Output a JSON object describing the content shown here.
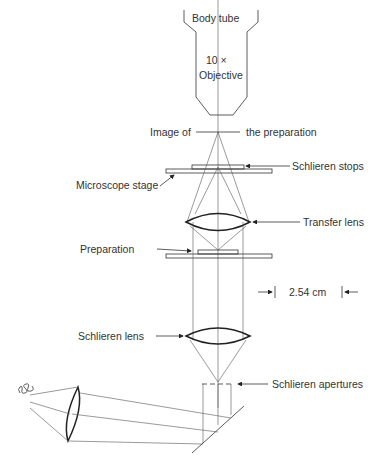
{
  "diagram": {
    "type": "optical schematic",
    "labels": {
      "body_tube": "Body tube",
      "objective_mag": "10 ×",
      "objective": "Objective",
      "image_of": "Image of",
      "the_preparation": "the preparation",
      "schlieren_stops": "Schlieren stops",
      "microscope_stage": "Microscope stage",
      "transfer_lens": "Transfer lens",
      "preparation": "Preparation",
      "dimension": "2.54 cm",
      "schlieren_lens": "Schlieren lens",
      "schlieren_apertures": "Schlieren apertures"
    },
    "colors": {
      "line": "#333333",
      "text": "#333333",
      "background": "#ffffff"
    }
  }
}
